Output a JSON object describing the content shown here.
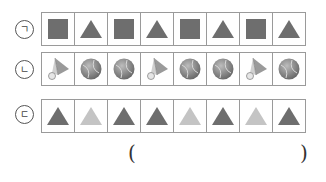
{
  "rows": [
    {
      "label": "ㄱ",
      "items": [
        "square",
        "triangle",
        "square",
        "triangle",
        "square",
        "triangle",
        "square",
        "triangle"
      ]
    },
    {
      "label": "ㄴ",
      "items": [
        "shuttlecock",
        "tennis-ball",
        "tennis-ball",
        "shuttlecock",
        "tennis-ball",
        "tennis-ball",
        "shuttlecock",
        "tennis-ball"
      ]
    },
    {
      "label": "ㄷ",
      "items": [
        "dark-triangle",
        "light-triangle",
        "dark-triangle",
        "dark-triangle",
        "light-triangle",
        "dark-triangle",
        "light-triangle",
        "dark-triangle"
      ]
    }
  ],
  "answer": {
    "open_paren": "(",
    "close_paren": ")",
    "value": ""
  },
  "colors": {
    "dark_shape": "#6e6e6e",
    "light_shape": "#c4c4c4",
    "border": "#9a9a9a"
  }
}
